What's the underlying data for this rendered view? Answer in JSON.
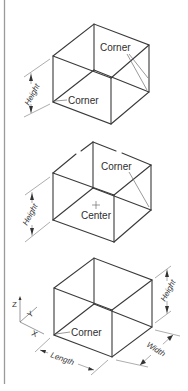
{
  "figures": [
    {
      "id": "box-corner-corner",
      "labels": {
        "corner_top": "Corner",
        "corner_bottom": "Corner",
        "height": "Height"
      }
    },
    {
      "id": "box-center-corner",
      "labels": {
        "corner_top": "Corner",
        "center": "Center",
        "height": "Height"
      }
    },
    {
      "id": "box-corner-dimensions",
      "labels": {
        "corner_bottom": "Corner",
        "height": "Height",
        "width": "Width",
        "length": "Length"
      },
      "axes": {
        "z": "Z",
        "y": "Y",
        "x": "X"
      }
    }
  ],
  "colors": {
    "line": "#3a3a3a",
    "leader": "#6e6e6e",
    "border": "#9a9a9a",
    "background": "#ffffff"
  }
}
